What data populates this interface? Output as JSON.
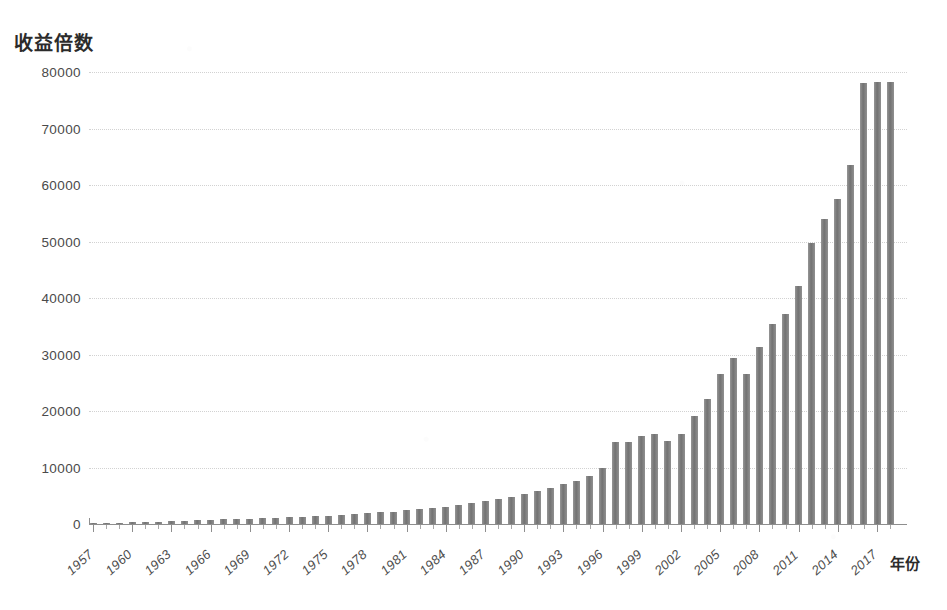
{
  "chart_data": {
    "type": "bar",
    "title": "",
    "ylabel": "收益倍数",
    "xlabel": "年份",
    "ylim": [
      0,
      80000
    ],
    "yticks": [
      0,
      10000,
      20000,
      30000,
      40000,
      50000,
      60000,
      70000,
      80000
    ],
    "ytick_labels": [
      "0",
      "10000",
      "20000",
      "30000",
      "40000",
      "50000",
      "60000",
      "70000",
      "80000"
    ],
    "grid": true,
    "legend": null,
    "bar_color": "#787878",
    "axis_color": "#8e8e8e",
    "grid_color": "#d2d2d2",
    "xtick_step_years": 3,
    "xtick_labels": [
      "1957",
      "1960",
      "1963",
      "1966",
      "1969",
      "1972",
      "1975",
      "1978",
      "1981",
      "1984",
      "1987",
      "1990",
      "1993",
      "1996",
      "1999",
      "2002",
      "2005",
      "2008",
      "2011",
      "2014",
      "2017"
    ],
    "categories": [
      "1957",
      "1958",
      "1959",
      "1960",
      "1961",
      "1962",
      "1963",
      "1964",
      "1965",
      "1966",
      "1967",
      "1968",
      "1969",
      "1970",
      "1971",
      "1972",
      "1973",
      "1974",
      "1975",
      "1976",
      "1977",
      "1978",
      "1979",
      "1980",
      "1981",
      "1982",
      "1983",
      "1984",
      "1985",
      "1986",
      "1987",
      "1988",
      "1989",
      "1990",
      "1991",
      "1992",
      "1993",
      "1994",
      "1995",
      "1996",
      "1997",
      "1998",
      "1999",
      "2000",
      "2001",
      "2002",
      "2003",
      "2004",
      "2005",
      "2006",
      "2007",
      "2008",
      "2009",
      "2010",
      "2011",
      "2012",
      "2013",
      "2014",
      "2015",
      "2016",
      "2017",
      "2018"
    ],
    "values": [
      10,
      20,
      30,
      45,
      60,
      75,
      95,
      115,
      140,
      165,
      190,
      230,
      260,
      290,
      330,
      380,
      420,
      460,
      520,
      600,
      700,
      820,
      950,
      1100,
      1300,
      1600,
      1900,
      2150,
      2500,
      3000,
      3300,
      3800,
      4500,
      5200,
      6400,
      7200,
      8000,
      8800,
      9800,
      11000,
      13800,
      16800,
      19500,
      22600,
      24400,
      27800,
      34000,
      37800,
      41000,
      47500,
      50500,
      35200,
      43200,
      47300,
      47600,
      56200,
      74500,
      83600,
      78200,
      90700,
      113100,
      113500
    ],
    "values_display_scale": "×倍"
  },
  "plot_values": [
    60,
    130,
    200,
    280,
    360,
    430,
    500,
    580,
    650,
    720,
    800,
    880,
    960,
    1040,
    1120,
    1200,
    1300,
    1400,
    1500,
    1620,
    1750,
    1900,
    2050,
    2200,
    2400,
    2600,
    2850,
    3100,
    3400,
    3700,
    4050,
    4400,
    4800,
    5300,
    5800,
    6400,
    7000,
    7700,
    8500,
    9900,
    14500,
    14600,
    15500,
    15900,
    14700,
    16000,
    19200,
    22200,
    26500,
    29400,
    26600,
    31400,
    35400,
    37200,
    42200,
    49700,
    53900,
    57600,
    63600,
    78000,
    78200,
    78200
  ]
}
